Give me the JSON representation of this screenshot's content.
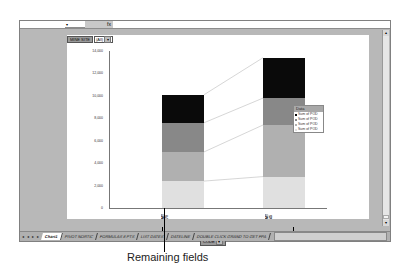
{
  "window": {
    "formula_bar": {
      "namebox_value": "",
      "fx_label": "fx",
      "formula_value": ""
    }
  },
  "chart": {
    "page_field": {
      "label": "MINE SITE",
      "value": "(All)"
    },
    "row_field": {
      "label": "CODE"
    },
    "legend": {
      "title": "Data",
      "items": [
        "Sum of POD",
        "Sum of POD",
        "Sum of POD",
        "Sum of POD"
      ]
    }
  },
  "chart_data": {
    "type": "bar",
    "stacked": true,
    "title": "",
    "xlabel": "CODE",
    "ylabel": "",
    "categories": [
      "MT 70",
      "MT 45"
    ],
    "series": [
      {
        "name": "Sum of POD",
        "color": "#e0e0e0",
        "values": [
          2400,
          2800
        ]
      },
      {
        "name": "Sum of POD",
        "color": "#b0b0b0",
        "values": [
          2600,
          4600
        ]
      },
      {
        "name": "Sum of POD",
        "color": "#888888",
        "values": [
          2600,
          2400
        ]
      },
      {
        "name": "Sum of POD",
        "color": "#0a0a0a",
        "values": [
          2500,
          3600
        ]
      }
    ],
    "yticks": [
      "0",
      "2,000",
      "4,000",
      "6,000",
      "8,000",
      "10,000",
      "12,000",
      "14,000"
    ],
    "ylim": [
      0,
      14000
    ],
    "grid": false,
    "legend_position": "right"
  },
  "sheet_tabs": {
    "tabs": [
      "Chart1",
      "PIVOT NORTIC",
      "FORMULAS 8 PTS",
      "LIST DATES",
      "DATELINE",
      "DOUBLE CLICK GRAND TO GET FPA"
    ],
    "active": "Chart1"
  },
  "annotation": {
    "caption": "Remaining fields"
  }
}
